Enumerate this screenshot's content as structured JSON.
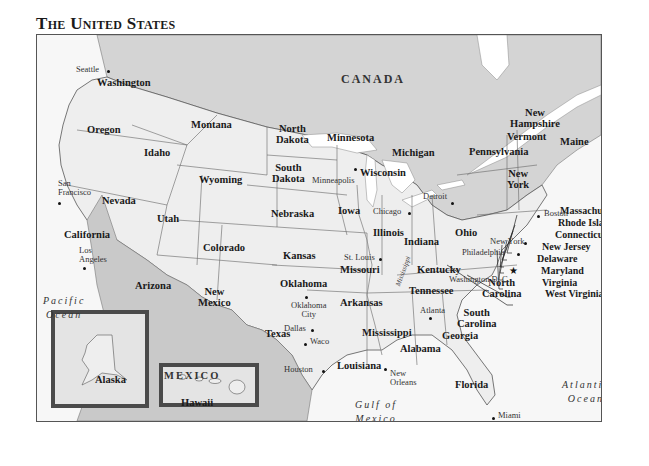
{
  "title": "The United States",
  "colors": {
    "us_land": "#eeeeee",
    "canada_land": "#d4d4d4",
    "mexico_land": "#c9c9c9",
    "water": "#f7f7f7",
    "lakes": "#ffffff",
    "borders": "#555555",
    "inset_frame": "#4a4a4a"
  },
  "countries": {
    "canada": "CANADA",
    "mexico": "MEXICO"
  },
  "water_bodies": {
    "pacific": [
      "Pacific",
      "Ocean"
    ],
    "atlantic": [
      "Atlantic",
      "Ocean"
    ],
    "gulf": [
      "Gulf of",
      "Mexico"
    ],
    "mississippi_river": "Mississippi"
  },
  "states": {
    "washington": "Washington",
    "oregon": "Oregon",
    "california": "California",
    "idaho": "Idaho",
    "nevada": "Nevada",
    "montana": "Montana",
    "wyoming": "Wyoming",
    "utah": "Utah",
    "arizona": "Arizona",
    "colorado": "Colorado",
    "new_mexico": [
      "New",
      "Mexico"
    ],
    "north_dakota": [
      "North",
      "Dakota"
    ],
    "south_dakota": [
      "South",
      "Dakota"
    ],
    "nebraska": "Nebraska",
    "kansas": "Kansas",
    "oklahoma": "Oklahoma",
    "texas": "Texas",
    "minnesota": "Minnesota",
    "iowa": "Iowa",
    "missouri": "Missouri",
    "arkansas": "Arkansas",
    "louisiana": "Louisiana",
    "wisconsin": "Wisconsin",
    "illinois": "Illinois",
    "michigan": "Michigan",
    "indiana": "Indiana",
    "ohio": "Ohio",
    "kentucky": "Kentucky",
    "tennessee": "Tennessee",
    "mississippi": "Mississippi",
    "alabama": "Alabama",
    "georgia": "Georgia",
    "florida": "Florida",
    "south_carolina": [
      "South",
      "Carolina"
    ],
    "north_carolina": [
      "North",
      "Carolina"
    ],
    "pennsylvania": "Pennsylvania",
    "new_york": [
      "New",
      "York"
    ],
    "vermont": "Vermont",
    "new_hampshire": [
      "New",
      "Hampshire"
    ],
    "maine": "Maine",
    "massachusetts": "Massachusetts",
    "rhode_island": "Rhode Island",
    "connecticut": "Connecticut",
    "new_jersey": "New Jersey",
    "delaware": "Delaware",
    "maryland": "Maryland",
    "virginia": "Virginia",
    "west_virginia": "West Virginia",
    "alaska": "Alaska",
    "hawaii": "Hawaii"
  },
  "cities": {
    "seattle": "Seattle",
    "san_francisco": [
      "San",
      "Francisco"
    ],
    "los_angeles": [
      "Los",
      "Angeles"
    ],
    "minneapolis": "Minneapolis",
    "chicago": "Chicago",
    "detroit": "Detroit",
    "st_louis": "St. Louis",
    "oklahoma_city": [
      "Oklahoma",
      "City"
    ],
    "dallas": "Dallas",
    "waco": "Waco",
    "houston": "Houston",
    "new_orleans": [
      "New",
      "Orleans"
    ],
    "atlanta": "Atlanta",
    "miami": "Miami",
    "washington_dc": "Washington D. C.",
    "philadelphia": "Philadelphia",
    "new_york_city": "New York",
    "boston": "Boston"
  }
}
